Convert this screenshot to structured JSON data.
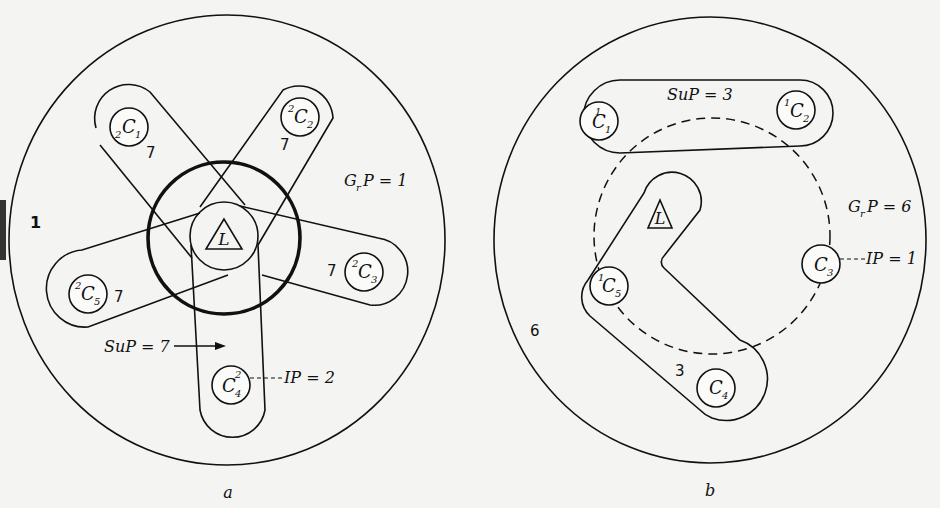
{
  "figure": {
    "panels": [
      {
        "id": "a",
        "caption": "a",
        "outer_region_label": "1",
        "grp_label": "G",
        "grp_sub": "r",
        "grp_rest": "P = 1",
        "sup_label": "SuP = 7",
        "ip_label": "IP = 2",
        "ligand": "L",
        "centers": [
          {
            "sup": "2",
            "name": "C",
            "sub": "1",
            "sym": "7"
          },
          {
            "sup": "2",
            "name": "C",
            "sub": "2",
            "sym": "7"
          },
          {
            "sup": "2",
            "name": "C",
            "sub": "3",
            "sym": "7"
          },
          {
            "sup": "2",
            "name": "C",
            "sub": "4",
            "sym": ""
          },
          {
            "sup": "2",
            "name": "C",
            "sub": "5",
            "sym": "7"
          }
        ]
      },
      {
        "id": "b",
        "caption": "b",
        "outer_region_label": "6",
        "grp_label": "G",
        "grp_sub": "r",
        "grp_rest": "P = 6",
        "sup_label": "SuP = 3",
        "ip_label": "IP = 1",
        "ligand": "L",
        "bent_group_label": "3",
        "centers": [
          {
            "sup": "1",
            "name": "C",
            "sub": "1"
          },
          {
            "sup": "1",
            "name": "C",
            "sub": "2"
          },
          {
            "sup": "",
            "name": "C",
            "sub": "3"
          },
          {
            "sup": "",
            "name": "C",
            "sub": "4"
          },
          {
            "sup": "1",
            "name": "C",
            "sub": "5"
          }
        ]
      }
    ]
  }
}
